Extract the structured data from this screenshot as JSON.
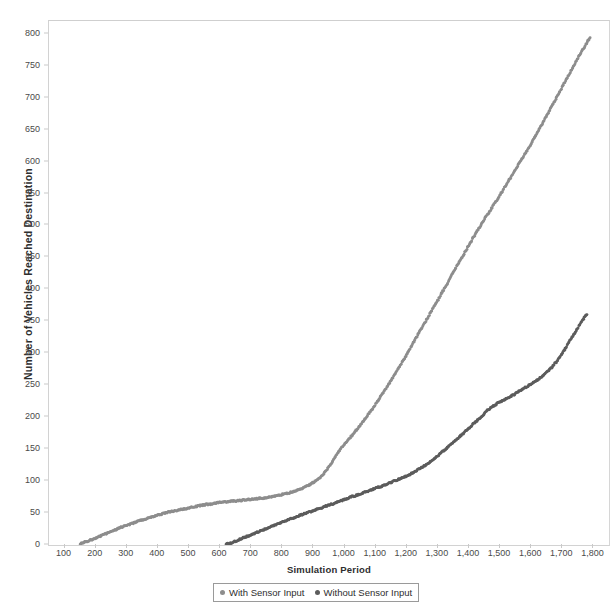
{
  "chart_data": {
    "type": "scatter",
    "title": "",
    "xlabel": "Simulation Period",
    "ylabel": "Number of Vehicles Reached Destination",
    "xlim": [
      50,
      1850
    ],
    "ylim": [
      0,
      820
    ],
    "xticks": [
      "100",
      "200",
      "300",
      "400",
      "500",
      "600",
      "700",
      "800",
      "900",
      "1,000",
      "1,100",
      "1,200",
      "1,300",
      "1,400",
      "1,500",
      "1,600",
      "1,700",
      "1,800"
    ],
    "xtick_values": [
      100,
      200,
      300,
      400,
      500,
      600,
      700,
      800,
      900,
      1000,
      1100,
      1200,
      1300,
      1400,
      1500,
      1600,
      1700,
      1800
    ],
    "yticks": [
      "0",
      "50",
      "100",
      "150",
      "200",
      "250",
      "300",
      "350",
      "400",
      "450",
      "500",
      "550",
      "600",
      "650",
      "700",
      "750",
      "800"
    ],
    "ytick_values": [
      0,
      50,
      100,
      150,
      200,
      250,
      300,
      350,
      400,
      450,
      500,
      550,
      600,
      650,
      700,
      750,
      800
    ],
    "grid": false,
    "legend_position": "bottom",
    "series": [
      {
        "name": "With Sensor Input",
        "color": "#8d8d8d",
        "marker": "dot",
        "x": [
          150,
          170,
          190,
          210,
          230,
          250,
          270,
          290,
          310,
          330,
          350,
          370,
          390,
          410,
          430,
          450,
          470,
          490,
          510,
          530,
          550,
          570,
          590,
          610,
          630,
          650,
          670,
          690,
          710,
          730,
          750,
          770,
          790,
          810,
          830,
          850,
          870,
          890,
          910,
          930,
          950,
          970,
          990,
          1010,
          1030,
          1050,
          1070,
          1090,
          1110,
          1130,
          1150,
          1170,
          1190,
          1210,
          1230,
          1250,
          1270,
          1290,
          1310,
          1330,
          1350,
          1370,
          1390,
          1410,
          1430,
          1450,
          1470,
          1490,
          1510,
          1530,
          1550,
          1570,
          1590,
          1610,
          1630,
          1650,
          1670,
          1690,
          1710,
          1730,
          1750,
          1770,
          1790
        ],
        "y": [
          2,
          5,
          9,
          13,
          17,
          21,
          25,
          29,
          32,
          36,
          39,
          42,
          45,
          48,
          51,
          53,
          55,
          57,
          59,
          61,
          63,
          64,
          66,
          67,
          68,
          69,
          70,
          71,
          72,
          73,
          74,
          76,
          78,
          80,
          83,
          86,
          90,
          95,
          101,
          110,
          122,
          138,
          152,
          163,
          175,
          187,
          200,
          213,
          228,
          243,
          258,
          274,
          290,
          307,
          324,
          341,
          358,
          375,
          392,
          409,
          427,
          444,
          461,
          478,
          494,
          510,
          525,
          540,
          556,
          572,
          588,
          604,
          620,
          637,
          654,
          672,
          690,
          708,
          726,
          744,
          762,
          779,
          795
        ]
      },
      {
        "name": "Without Sensor Input",
        "color": "#5c5c5c",
        "marker": "dot",
        "x": [
          620,
          640,
          660,
          680,
          700,
          720,
          740,
          760,
          780,
          800,
          820,
          840,
          860,
          880,
          900,
          920,
          940,
          960,
          980,
          1000,
          1020,
          1040,
          1060,
          1080,
          1100,
          1120,
          1140,
          1160,
          1180,
          1200,
          1220,
          1240,
          1260,
          1280,
          1300,
          1320,
          1340,
          1360,
          1380,
          1400,
          1420,
          1440,
          1460,
          1480,
          1500,
          1520,
          1540,
          1560,
          1580,
          1600,
          1620,
          1640,
          1660,
          1680,
          1700,
          1720,
          1740,
          1760,
          1780
        ],
        "y": [
          1,
          4,
          8,
          12,
          16,
          20,
          24,
          28,
          32,
          36,
          40,
          43,
          47,
          50,
          54,
          57,
          61,
          64,
          68,
          71,
          75,
          78,
          82,
          85,
          89,
          92,
          96,
          100,
          104,
          108,
          113,
          119,
          125,
          132,
          140,
          148,
          156,
          165,
          174,
          183,
          192,
          201,
          211,
          218,
          224,
          229,
          234,
          240,
          246,
          252,
          258,
          266,
          275,
          286,
          300,
          316,
          332,
          348,
          362
        ]
      }
    ]
  },
  "legend": {
    "items": [
      {
        "label": "With Sensor Input",
        "color": "#8d8d8d"
      },
      {
        "label": "Without Sensor Input",
        "color": "#5c5c5c"
      }
    ]
  }
}
